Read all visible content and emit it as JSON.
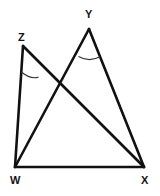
{
  "figure": {
    "background_color": "#ffffff",
    "stroke_color": "#111111",
    "arc_color": "#333333",
    "label_color": "#141414",
    "width": 160,
    "height": 196,
    "vertices": [
      {
        "name": "Z",
        "label": "Z",
        "x": 23,
        "y": 46,
        "label_x": 18,
        "label_y": 32
      },
      {
        "name": "Y",
        "label": "Y",
        "x": 89,
        "y": 29,
        "label_x": 85,
        "label_y": 9
      },
      {
        "name": "W",
        "label": "W",
        "x": 15,
        "y": 167,
        "label_x": 10,
        "label_y": 175
      },
      {
        "name": "X",
        "label": "X",
        "x": 144,
        "y": 167,
        "label_x": 141,
        "label_y": 175
      }
    ],
    "segments": [
      {
        "name": "segment-ZW",
        "from": "Z",
        "to": "W",
        "path": "M 23 46 L 15 167"
      },
      {
        "name": "segment-ZX",
        "from": "Z",
        "to": "X",
        "path": "M 23 46 L 144 167"
      },
      {
        "name": "segment-YW",
        "from": "Y",
        "to": "W",
        "path": "M 89 29 L 15 167"
      },
      {
        "name": "segment-YX",
        "from": "Y",
        "to": "X",
        "path": "M 89 29 L 144 167"
      },
      {
        "name": "segment-WX",
        "from": "W",
        "to": "X",
        "path": "M 15 167 L 144 167"
      }
    ],
    "angle_arcs": [
      {
        "name": "angle-arc-Z",
        "at": "Z",
        "angle": "WZX",
        "path": "M 21.3 72.0 Q 31.5 80.0 38.5 77.0"
      },
      {
        "name": "angle-arc-Y",
        "at": "Y",
        "angle": "WYX",
        "path": "M 78.5 56.5 Q 89.0 62.5 100.0 56.8"
      }
    ],
    "intersection": {
      "name": "intersection-ZX-YW",
      "x": 60,
      "y": 88
    }
  }
}
